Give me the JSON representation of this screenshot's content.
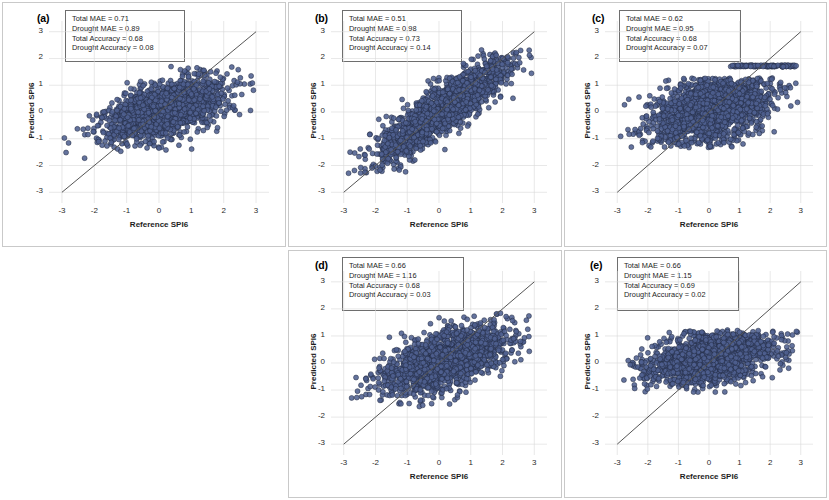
{
  "figure": {
    "axis_labels": {
      "x": "Reference SPI6",
      "y": "Predicted SPI6"
    },
    "tick_labels": [
      "-3",
      "-2",
      "-1",
      "0",
      "1",
      "2",
      "3"
    ],
    "marker_color": "#4f608f",
    "marker_edge_color": "#20283f",
    "identity_line_color": "#555555",
    "grid_color": "#d8d8d8",
    "panel_border_color": "#c9c9c9"
  },
  "chart_data": [
    {
      "type": "scatter",
      "panel": "a",
      "tag": "(a)",
      "title": "",
      "xlabel": "Reference SPI6",
      "ylabel": "Predicted SPI6",
      "xlim": [
        -3.4,
        3.4
      ],
      "ylim": [
        -3.4,
        3.4
      ],
      "xticks": [
        -3,
        -2,
        -1,
        0,
        1,
        2,
        3
      ],
      "yticks": [
        -3,
        -2,
        -1,
        0,
        1,
        2,
        3
      ],
      "grid": true,
      "legend": "none",
      "reference_line": {
        "type": "identity",
        "from": [
          -3,
          -3
        ],
        "to": [
          3,
          3
        ]
      },
      "annotations": [
        "Total MAE = 0.71",
        "Drought MAE = 0.89",
        "Total Accuracy = 0.68",
        "Drought Accuracy = 0.08"
      ],
      "metrics": {
        "total_mae": 0.71,
        "drought_mae": 0.89,
        "total_accuracy": 0.68,
        "drought_accuracy": 0.08
      },
      "cloud": {
        "n": 1650,
        "x_mean": 0.15,
        "x_sd": 0.95,
        "y_mean": 0.05,
        "y_sd": 0.58,
        "correlation": 0.55,
        "y_clip": [
          -1.85,
          1.95
        ],
        "x_clip": [
          -2.95,
          2.95
        ],
        "seed": 11
      }
    },
    {
      "type": "scatter",
      "panel": "b",
      "tag": "(b)",
      "title": "",
      "xlabel": "Reference SPI6",
      "ylabel": "Predicted SPI6",
      "xlim": [
        -3.4,
        3.4
      ],
      "ylim": [
        -3.4,
        3.4
      ],
      "xticks": [
        -3,
        -2,
        -1,
        0,
        1,
        2,
        3
      ],
      "yticks": [
        -3,
        -2,
        -1,
        0,
        1,
        2,
        3
      ],
      "grid": true,
      "legend": "none",
      "reference_line": {
        "type": "identity",
        "from": [
          -3,
          -3
        ],
        "to": [
          3,
          3
        ]
      },
      "annotations": [
        "Total MAE = 0.51",
        "Drought MAE = 0.98",
        "Total Accuracy = 0.73",
        "Drought Accuracy = 0.14"
      ],
      "metrics": {
        "total_mae": 0.51,
        "drought_mae": 0.98,
        "total_accuracy": 0.73,
        "drought_accuracy": 0.14
      },
      "cloud": {
        "n": 1750,
        "x_mean": 0.12,
        "x_sd": 1.05,
        "y_mean": 0.08,
        "y_sd": 0.95,
        "correlation": 0.88,
        "y_clip": [
          -2.3,
          2.35
        ],
        "x_clip": [
          -2.95,
          2.95
        ],
        "seed": 22
      }
    },
    {
      "type": "scatter",
      "panel": "c",
      "tag": "(c)",
      "title": "",
      "xlabel": "Reference SPI6",
      "ylabel": "Predicted SPI6",
      "xlim": [
        -3.4,
        3.4
      ],
      "ylim": [
        -3.4,
        3.4
      ],
      "xticks": [
        -3,
        -2,
        -1,
        0,
        1,
        2,
        3
      ],
      "yticks": [
        -3,
        -2,
        -1,
        0,
        1,
        2,
        3
      ],
      "grid": true,
      "legend": "none",
      "reference_line": {
        "type": "identity",
        "from": [
          -3,
          -3
        ],
        "to": [
          3,
          3
        ]
      },
      "annotations": [
        "Total MAE = 0.62",
        "Drought MAE = 0.95",
        "Total Accuracy = 0.68",
        "Drought Accuracy = 0.07"
      ],
      "metrics": {
        "total_mae": 0.62,
        "drought_mae": 0.95,
        "total_accuracy": 0.68,
        "drought_accuracy": 0.07
      },
      "cloud": {
        "n": 1800,
        "x_mean": 0.05,
        "x_sd": 1.0,
        "y_mean": 0.1,
        "y_sd": 0.72,
        "correlation": 0.45,
        "y_clip": [
          -1.35,
          1.28
        ],
        "x_clip": [
          -2.9,
          2.9
        ],
        "seed": 33,
        "saturation_band": {
          "y": 1.72,
          "x_from": 0.7,
          "x_to": 2.85,
          "n": 120
        }
      }
    },
    {
      "type": "scatter",
      "panel": "d",
      "tag": "(d)",
      "title": "",
      "xlabel": "Reference SPI6",
      "ylabel": "Predicted SPI6",
      "xlim": [
        -3.4,
        3.4
      ],
      "ylim": [
        -3.4,
        3.4
      ],
      "xticks": [
        -3,
        -2,
        -1,
        0,
        1,
        2,
        3
      ],
      "yticks": [
        -3,
        -2,
        -1,
        0,
        1,
        2,
        3
      ],
      "grid": true,
      "legend": "none",
      "reference_line": {
        "type": "identity",
        "from": [
          -3,
          -3
        ],
        "to": [
          3,
          3
        ]
      },
      "annotations": [
        "Total MAE = 0.66",
        "Drought MAE = 1.16",
        "Total Accuracy = 0.68",
        "Drought Accuracy = 0.03"
      ],
      "metrics": {
        "total_mae": 0.66,
        "drought_mae": 1.16,
        "total_accuracy": 0.68,
        "drought_accuracy": 0.03
      },
      "cloud": {
        "n": 1750,
        "x_mean": 0.2,
        "x_sd": 1.0,
        "y_mean": 0.12,
        "y_sd": 0.62,
        "correlation": 0.6,
        "y_clip": [
          -1.7,
          1.85
        ],
        "x_clip": [
          -2.9,
          2.9
        ],
        "seed": 44
      }
    },
    {
      "type": "scatter",
      "panel": "e",
      "tag": "(e)",
      "title": "",
      "xlabel": "Reference SPI6",
      "ylabel": "Predicted SPI6",
      "xlim": [
        -3.4,
        3.4
      ],
      "ylim": [
        -3.4,
        3.4
      ],
      "xticks": [
        -3,
        -2,
        -1,
        0,
        1,
        2,
        3
      ],
      "yticks": [
        -3,
        -2,
        -1,
        0,
        1,
        2,
        3
      ],
      "grid": true,
      "legend": "none",
      "reference_line": {
        "type": "identity",
        "from": [
          -3,
          -3
        ],
        "to": [
          3,
          3
        ]
      },
      "annotations": [
        "Total MAE = 0.66",
        "Drought MAE = 1.15",
        "Total Accuracy = 0.69",
        "Drought Accuracy = 0.02"
      ],
      "metrics": {
        "total_mae": 0.66,
        "drought_mae": 1.15,
        "total_accuracy": 0.69,
        "drought_accuracy": 0.02
      },
      "cloud": {
        "n": 1800,
        "x_mean": 0.12,
        "x_sd": 1.05,
        "y_mean": 0.2,
        "y_sd": 0.5,
        "correlation": 0.38,
        "y_clip": [
          -1.1,
          1.22
        ],
        "x_clip": [
          -2.9,
          2.9
        ],
        "seed": 55
      }
    }
  ]
}
